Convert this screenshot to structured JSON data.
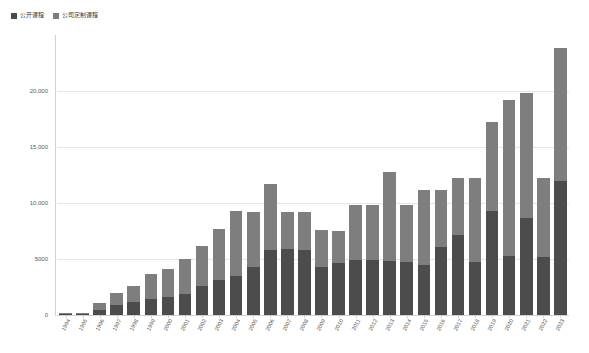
{
  "legend": {
    "position": "top-left",
    "entries": [
      {
        "label": "公开课程",
        "color": "#4c4c4c",
        "icon": "square-swatch-icon"
      },
      {
        "label": "公司定制课程",
        "color": "#7e7e7e",
        "icon": "square-swatch-icon"
      }
    ]
  },
  "chart_data": {
    "type": "bar",
    "subtype": "stacked-vertical-bar",
    "title": "",
    "subtitle": "",
    "xlabel": "",
    "ylabel": "",
    "ylim": [
      0,
      25000
    ],
    "grid": true,
    "ytick_labels": [
      "0",
      "5000",
      "10,000",
      "15,000",
      "20,000"
    ],
    "ytick_values": [
      0,
      5000,
      10000,
      15000,
      20000
    ],
    "categories": [
      "1994",
      "1995",
      "1996",
      "1997",
      "1998",
      "1999",
      "2000",
      "2001",
      "2002",
      "2003",
      "2004",
      "2005",
      "2006",
      "2007",
      "2008",
      "2009",
      "2010",
      "2011",
      "2012",
      "2013",
      "2014",
      "2015",
      "2016",
      "2017",
      "2018",
      "2019",
      "2020",
      "2021",
      "2022",
      "2023"
    ],
    "series": [
      {
        "name": "公开课程",
        "color": "#4c4c4c",
        "values": [
          80,
          120,
          450,
          900,
          1200,
          1400,
          1600,
          1900,
          2600,
          3100,
          3500,
          4300,
          5800,
          5900,
          5800,
          4300,
          4600,
          4900,
          4900,
          4800,
          4700,
          4500,
          6100,
          7100,
          4700,
          9300,
          5300,
          8700,
          5200,
          12000
        ]
      },
      {
        "name": "公司定制课程",
        "color": "#7e7e7e",
        "values": [
          60,
          100,
          650,
          1100,
          1400,
          2300,
          2500,
          3100,
          3600,
          4600,
          5800,
          4900,
          5900,
          3300,
          3400,
          3300,
          2900,
          4900,
          4900,
          8000,
          5100,
          6700,
          5100,
          5100,
          7500,
          7900,
          13900,
          11100,
          7000,
          11800
        ]
      }
    ],
    "totals": [
      140,
      220,
      1100,
      2000,
      2600,
      3700,
      4100,
      5000,
      6200,
      7700,
      9300,
      9200,
      11700,
      9200,
      9200,
      7600,
      7500,
      9800,
      9800,
      12800,
      9800,
      11200,
      11200,
      12200,
      12200,
      17200,
      19200,
      19800,
      12200,
      23800
    ]
  }
}
